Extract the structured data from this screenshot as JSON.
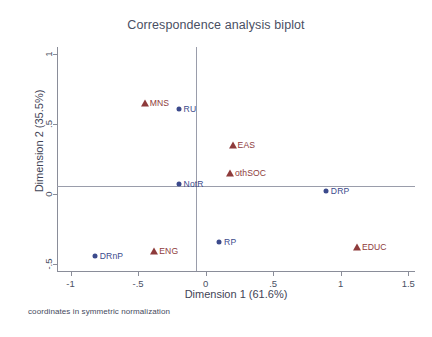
{
  "chart_data": {
    "type": "scatter",
    "title": "Correspondence analysis biplot",
    "xlabel": "Dimension 1 (61.6%)",
    "ylabel": "Dimension 2 (35.5%)",
    "footnote": "coordinates in symmetric normalization",
    "xlim": [
      -1.1,
      1.55
    ],
    "ylim": [
      -0.55,
      1.05
    ],
    "xticks": [
      -1,
      -0.5,
      0,
      0.5,
      1,
      1.5
    ],
    "xticklabels": [
      "-1",
      "-.5",
      "0",
      ".5",
      "1",
      "1.5"
    ],
    "yticks": [
      1,
      0.5,
      0,
      -0.5
    ],
    "yticklabels": [
      "1",
      ".5",
      "0",
      "-.5"
    ],
    "grid": false,
    "legend": null,
    "zero_lines": true,
    "colors": {
      "row_points": "#8e3b3b",
      "column_points": "#3b4a8c",
      "axis": "#8a8d99",
      "title": "#4a4f63"
    },
    "series": [
      {
        "name": "row categories",
        "marker": "triangle",
        "color": "#8e3b3b",
        "points": [
          {
            "label": "MNS",
            "x": -0.45,
            "y": 0.65
          },
          {
            "label": "EAS",
            "x": 0.2,
            "y": 0.35
          },
          {
            "label": "othSOC",
            "x": 0.18,
            "y": 0.15
          },
          {
            "label": "ENG",
            "x": -0.38,
            "y": -0.41
          },
          {
            "label": "EDUC",
            "x": 1.12,
            "y": -0.38
          }
        ]
      },
      {
        "name": "column categories",
        "marker": "circle",
        "color": "#3b4a8c",
        "points": [
          {
            "label": "RU",
            "x": -0.2,
            "y": 0.61
          },
          {
            "label": "NotR",
            "x": -0.2,
            "y": 0.07
          },
          {
            "label": "DRP",
            "x": 0.89,
            "y": 0.02
          },
          {
            "label": "RP",
            "x": 0.1,
            "y": -0.34
          },
          {
            "label": "DRnP",
            "x": -0.82,
            "y": -0.44
          }
        ]
      }
    ]
  }
}
